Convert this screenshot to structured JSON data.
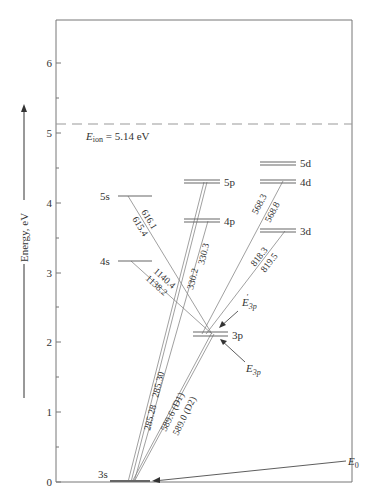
{
  "diagram": {
    "axis": {
      "label": "Energy, eV",
      "ticks": [
        "0",
        "1",
        "2",
        "3",
        "4",
        "5",
        "6"
      ],
      "min": 0,
      "max": 6.5
    },
    "ionization": {
      "label_sym": "E",
      "label_sub": "ion",
      "label_rest": " = 5.14 eV",
      "value": 5.14
    },
    "levels": [
      {
        "name": "3s",
        "energy": 0.0
      },
      {
        "name": "3p",
        "energy": 2.1
      },
      {
        "name": "4s",
        "energy": 3.19
      },
      {
        "name": "3d",
        "energy": 3.62
      },
      {
        "name": "4p",
        "energy": 3.75
      },
      {
        "name": "5s",
        "energy": 4.12
      },
      {
        "name": "4d",
        "energy": 4.29
      },
      {
        "name": "5p",
        "energy": 4.34
      },
      {
        "name": "5d",
        "energy": 4.59
      }
    ],
    "transitions": [
      {
        "label": "285.28",
        "from": "5p",
        "to": "3s"
      },
      {
        "label": "285.30",
        "from": "5p",
        "to": "3s"
      },
      {
        "label": "330.2",
        "from": "4p",
        "to": "3s"
      },
      {
        "label": "330.3",
        "from": "4p",
        "to": "3s"
      },
      {
        "label": "589.6 (D1)",
        "from": "3p",
        "to": "3s"
      },
      {
        "label": "589.0 (D2)",
        "from": "3p",
        "to": "3s"
      },
      {
        "label": "616.1",
        "from": "5s",
        "to": "3p"
      },
      {
        "label": "615.4",
        "from": "5s",
        "to": "3p"
      },
      {
        "label": "1140.4",
        "from": "4s",
        "to": "3p"
      },
      {
        "label": "1138.2",
        "from": "4s",
        "to": "3p"
      },
      {
        "label": "568.3",
        "from": "4d",
        "to": "3p"
      },
      {
        "label": "568.8",
        "from": "4d",
        "to": "3p"
      },
      {
        "label": "818.3",
        "from": "3d",
        "to": "3p"
      },
      {
        "label": "819.5",
        "from": "3d",
        "to": "3p"
      }
    ],
    "annotations": [
      {
        "sym": "E",
        "sub": "3p",
        "prime": true,
        "target": "3p upper"
      },
      {
        "sym": "E",
        "sub": "3p",
        "prime": false,
        "target": "3p lower"
      },
      {
        "sym": "E",
        "sub": "0",
        "prime": false,
        "target": "3s"
      }
    ]
  }
}
